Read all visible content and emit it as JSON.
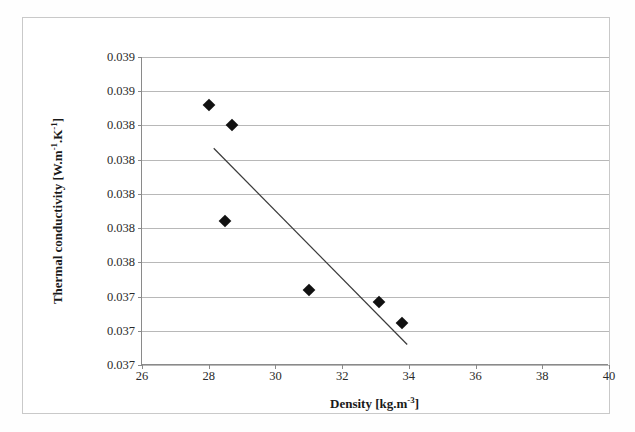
{
  "figure": {
    "kind": "scatter-plot-with-trendline",
    "background_color": "#ffffff",
    "frame_color": "#c9c9c9",
    "axis_color": "#8a8a8a",
    "grid_color": "#b8b8b8",
    "marker_color": "#111111",
    "trendline_color": "#3a3a3a"
  },
  "chart_data": {
    "type": "scatter",
    "title": "",
    "xlabel": "Density [kg.m-3]",
    "xlabel_parts": {
      "name": "Density",
      "unit_base": "[kg.m",
      "unit_exp": "-3",
      "unit_close": "]"
    },
    "ylabel": "Thermal conductivity [W.m-1.K-1]",
    "ylabel_parts": {
      "name": "Thermal conductivity",
      "unit_open": "[W.m",
      "unit_exp1": "-1",
      "unit_mid": ".K",
      "unit_exp2": "-1",
      "unit_close": "]"
    },
    "xlim": [
      26,
      40
    ],
    "ylim": [
      0.0365,
      0.0392
    ],
    "xticks": [
      26,
      28,
      30,
      32,
      34,
      36,
      38,
      40
    ],
    "xticklabels": [
      "26",
      "28",
      "30",
      "32",
      "34",
      "36",
      "38",
      "40"
    ],
    "yticks": [
      0.0392,
      0.0389,
      0.0386,
      0.0383,
      0.038,
      0.0377,
      0.0374,
      0.0371,
      0.0368,
      0.0365
    ],
    "yticklabels": [
      "0.039",
      "0.039",
      "0.038",
      "0.038",
      "0.038",
      "0.038",
      "0.038",
      "0.037",
      "0.037",
      "0.037"
    ],
    "grid": true,
    "grid_axis": "y",
    "legend": false,
    "legend_position": "none",
    "marker_symbol": "diamond",
    "points": [
      {
        "x": 28.0,
        "y": 0.03878
      },
      {
        "x": 28.7,
        "y": 0.0386
      },
      {
        "x": 28.5,
        "y": 0.03776
      },
      {
        "x": 31.0,
        "y": 0.03716
      },
      {
        "x": 33.1,
        "y": 0.03705
      },
      {
        "x": 33.8,
        "y": 0.03687
      },
      {
        "x": 27.8,
        "y": 0.03758
      }
    ],
    "series": [
      {
        "name": "Measured samples",
        "x": [
          28.0,
          28.7,
          28.5,
          31.0,
          33.1,
          33.8
        ],
        "y": [
          0.03878,
          0.0386,
          0.03776,
          0.03716,
          0.03705,
          0.03687
        ]
      }
    ],
    "trendline": {
      "type": "linear",
      "x_start": 28.15,
      "y_start": 0.0384,
      "x_end": 33.95,
      "y_end": 0.03668
    }
  }
}
